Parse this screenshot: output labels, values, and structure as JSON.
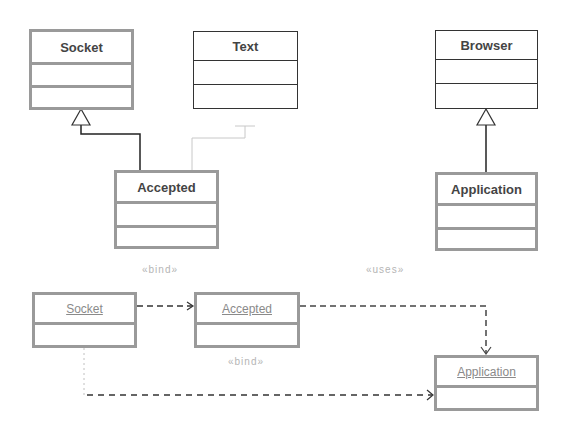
{
  "class_diagram": {
    "classes": [
      {
        "name": "Socket"
      },
      {
        "name": "Text"
      },
      {
        "name": "Accepted"
      },
      {
        "name": "Browser"
      },
      {
        "name": "Application"
      }
    ],
    "relations": [
      {
        "from": "Accepted",
        "to": "Socket",
        "type": "generalization"
      },
      {
        "from": "Accepted",
        "to": "Text",
        "type": "realization"
      },
      {
        "from": "Application",
        "to": "Browser",
        "type": "generalization"
      }
    ]
  },
  "object_diagram": {
    "objects": [
      {
        "name": "Socket"
      },
      {
        "name": "Accepted"
      },
      {
        "name": "Application"
      }
    ],
    "labels": {
      "bind_top": "«bind»",
      "uses": "«uses»",
      "bind_bottom": "«bind»"
    },
    "relations": [
      {
        "from": "Socket",
        "to": "Accepted",
        "type": "dependency",
        "stereotype": "«bind»"
      },
      {
        "from": "Accepted",
        "to": "Application",
        "type": "dependency",
        "stereotype": "«uses»"
      },
      {
        "from": "Socket",
        "to": "Application",
        "type": "dependency",
        "stereotype": "«bind»"
      }
    ]
  }
}
